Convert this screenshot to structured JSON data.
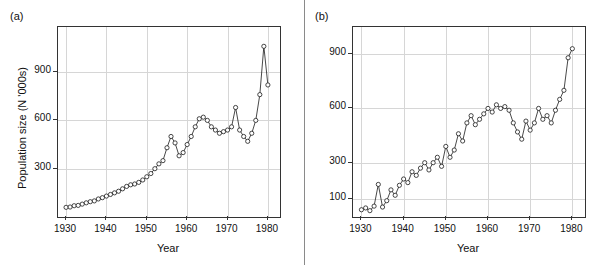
{
  "figure": {
    "background": "#ffffff",
    "line_color": "#1a1a1a",
    "grid_color": "#d6d6d6"
  },
  "panels": [
    {
      "tag": "(a)",
      "xlabel": "Year",
      "ylabel": "Population size (N '000s)"
    },
    {
      "tag": "(b)",
      "xlabel": "Year",
      "ylabel": ""
    }
  ],
  "chart_data": [
    {
      "type": "line",
      "title": "",
      "panel": "(a)",
      "xlabel": "Year",
      "ylabel": "Population size (N '000s)",
      "xlim": [
        1928,
        1983
      ],
      "ylim": [
        0,
        1180
      ],
      "xticks": [
        1930,
        1940,
        1950,
        1960,
        1970,
        1980
      ],
      "xticklabels": [
        "1930",
        "1940",
        "1950",
        "1960",
        "1970",
        "1980"
      ],
      "yticks": [
        300,
        600,
        900
      ],
      "yticklabels": [
        "300",
        "600",
        "900"
      ],
      "grid": true,
      "markers": "open-circle",
      "x": [
        1930,
        1931,
        1932,
        1933,
        1934,
        1935,
        1936,
        1937,
        1938,
        1939,
        1940,
        1941,
        1942,
        1943,
        1944,
        1945,
        1946,
        1947,
        1948,
        1949,
        1950,
        1951,
        1952,
        1953,
        1954,
        1955,
        1956,
        1957,
        1958,
        1959,
        1960,
        1961,
        1962,
        1963,
        1964,
        1965,
        1966,
        1967,
        1968,
        1969,
        1970,
        1971,
        1972,
        1973,
        1974,
        1975,
        1976,
        1977,
        1978,
        1979,
        1980
      ],
      "y": [
        60,
        62,
        70,
        72,
        80,
        88,
        95,
        100,
        112,
        120,
        130,
        140,
        150,
        160,
        175,
        190,
        200,
        205,
        215,
        230,
        250,
        270,
        300,
        330,
        350,
        430,
        500,
        460,
        380,
        400,
        450,
        500,
        560,
        610,
        620,
        600,
        560,
        540,
        520,
        530,
        540,
        560,
        680,
        540,
        500,
        470,
        520,
        600,
        760,
        1060,
        820,
        600
      ]
    },
    {
      "type": "line",
      "title": "",
      "panel": "(b)",
      "xlabel": "Year",
      "ylabel": "",
      "xlim": [
        1928,
        1983
      ],
      "ylim": [
        0,
        1050
      ],
      "xticks": [
        1930,
        1940,
        1950,
        1960,
        1970,
        1980
      ],
      "xticklabels": [
        "1930",
        "1940",
        "1950",
        "1960",
        "1970",
        "1980"
      ],
      "yticks": [
        100,
        300,
        600,
        900
      ],
      "yticklabels": [
        "100",
        "300",
        "600",
        "900"
      ],
      "grid": true,
      "markers": "open-circle",
      "x": [
        1930,
        1931,
        1932,
        1933,
        1934,
        1935,
        1936,
        1937,
        1938,
        1939,
        1940,
        1941,
        1942,
        1943,
        1944,
        1945,
        1946,
        1947,
        1948,
        1949,
        1950,
        1951,
        1952,
        1953,
        1954,
        1955,
        1956,
        1957,
        1958,
        1959,
        1960,
        1961,
        1962,
        1963,
        1964,
        1965,
        1966,
        1967,
        1968,
        1969,
        1970,
        1971,
        1972,
        1973,
        1974,
        1975,
        1976,
        1977,
        1978,
        1979,
        1980
      ],
      "y": [
        40,
        50,
        35,
        60,
        180,
        55,
        90,
        150,
        120,
        175,
        210,
        190,
        250,
        230,
        270,
        300,
        260,
        300,
        330,
        280,
        390,
        330,
        370,
        460,
        420,
        520,
        560,
        510,
        540,
        570,
        600,
        580,
        620,
        600,
        610,
        590,
        520,
        470,
        430,
        530,
        480,
        520,
        600,
        540,
        560,
        520,
        590,
        650,
        700,
        880,
        930,
        600
      ]
    }
  ]
}
